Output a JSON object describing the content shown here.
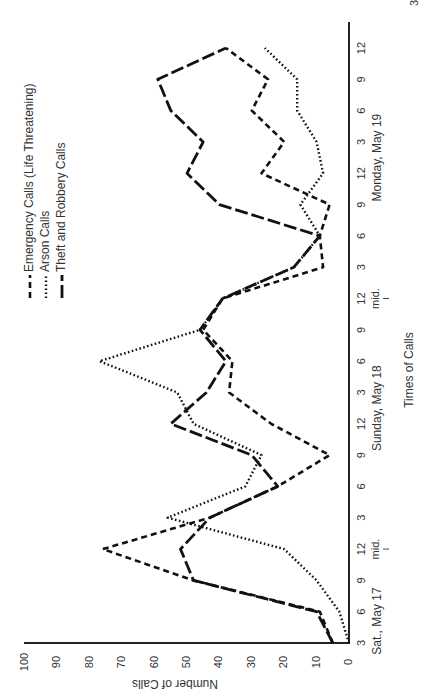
{
  "page": {
    "page_number_fragment": "37"
  },
  "chart_data": {
    "type": "line",
    "orientation": "rotated-90-ccw",
    "title": "",
    "xlabel": "Times of Calls",
    "ylabel": "Number of Calls",
    "ylim": [
      0,
      100
    ],
    "yticks": [
      0,
      10,
      20,
      30,
      40,
      50,
      60,
      70,
      80,
      90,
      100
    ],
    "grid": false,
    "legend_position": "top-left (rotated)",
    "categories": [
      "3",
      "6",
      "9",
      "12",
      "3",
      "6",
      "9",
      "12",
      "3",
      "6",
      "9",
      "12",
      "3",
      "6",
      "9",
      "12",
      "3",
      "6",
      "9",
      "12"
    ],
    "day_labels": [
      {
        "label": "Sat., May 17",
        "at_index": 0.7
      },
      {
        "label": "Sunday, May 18",
        "at_index": 7.5
      },
      {
        "label": "Monday, May 19",
        "at_index": 15.5
      }
    ],
    "midnight_markers": [
      {
        "label": "mid.",
        "at_index": 3
      },
      {
        "label": "mid.",
        "at_index": 11
      }
    ],
    "series": [
      {
        "name": "Emergency Calls (Life Threatening)",
        "style": "short-dash",
        "values": [
          5,
          9,
          48,
          76,
          43,
          22,
          6,
          24,
          37,
          36,
          45,
          39,
          8,
          9,
          6,
          27,
          20,
          30,
          25,
          38
        ]
      },
      {
        "name": "Arson Calls",
        "style": "dotted",
        "values": [
          0,
          3,
          10,
          20,
          56,
          32,
          27,
          48,
          53,
          77,
          46,
          39,
          17,
          9,
          15,
          8,
          10,
          16,
          16,
          26
        ]
      },
      {
        "name": "Theft and Robbery Calls",
        "style": "long-dash",
        "values": [
          5,
          10,
          48,
          52,
          43,
          22,
          30,
          55,
          44,
          38,
          46,
          39,
          17,
          9,
          40,
          50,
          45,
          55,
          59,
          38
        ]
      }
    ]
  }
}
